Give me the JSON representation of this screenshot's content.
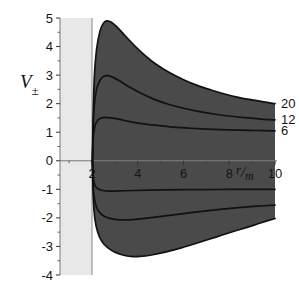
{
  "figure": {
    "kind": "effective-potential-plot",
    "background_color": "#ffffff",
    "shaded_band_color": "#e8e8e8",
    "region_fill_color": "#4a4a4a",
    "curve_color": "#111111",
    "axis_color": "#777777"
  },
  "chart_data": {
    "type": "line",
    "title": "",
    "subtitle": "",
    "xlabel": "r/m",
    "ylabel": "V±",
    "xlim": [
      0,
      10
    ],
    "ylim": [
      -4,
      5
    ],
    "grid": false,
    "legend_position": "right-edge",
    "x_ticks": [
      2,
      4,
      6,
      8,
      10
    ],
    "x_tick_labels": [
      "2",
      "4",
      "6",
      "8",
      "10"
    ],
    "x_minor_ticks": [
      1,
      3,
      5,
      7,
      9
    ],
    "y_ticks": [
      -4,
      -3,
      -2,
      -1,
      0,
      1,
      2,
      3,
      4,
      5
    ],
    "y_tick_labels": [
      "-4",
      "-3",
      "-2",
      "-1",
      "0",
      "1",
      "2",
      "3",
      "4",
      "5"
    ],
    "y_minor_ticks": [
      -3.5,
      -2.5,
      -1.5,
      -0.5,
      0.5,
      1.5,
      2.5,
      3.5,
      4.5
    ],
    "horizon_x": 2,
    "shaded_band_x_range": [
      0.45,
      2.0
    ],
    "annotations": [
      {
        "text": "20",
        "x": 10,
        "y": 2.0,
        "placement": "right"
      },
      {
        "text": "12",
        "x": 10,
        "y": 1.45,
        "placement": "right"
      },
      {
        "text": "6",
        "x": 10,
        "y": 1.05,
        "placement": "right"
      }
    ],
    "series": [
      {
        "name": "V+ L=20",
        "label": "20",
        "branch": "upper",
        "points": [
          [
            2.02,
            0.0
          ],
          [
            2.05,
            1.6
          ],
          [
            2.1,
            2.9
          ],
          [
            2.2,
            3.9
          ],
          [
            2.35,
            4.55
          ],
          [
            2.5,
            4.82
          ],
          [
            2.65,
            4.9
          ],
          [
            2.85,
            4.85
          ],
          [
            3.1,
            4.68
          ],
          [
            3.4,
            4.42
          ],
          [
            3.8,
            4.08
          ],
          [
            4.3,
            3.7
          ],
          [
            4.8,
            3.38
          ],
          [
            5.4,
            3.08
          ],
          [
            6.0,
            2.84
          ],
          [
            6.6,
            2.64
          ],
          [
            7.2,
            2.48
          ],
          [
            7.8,
            2.34
          ],
          [
            8.4,
            2.22
          ],
          [
            9.0,
            2.13
          ],
          [
            9.5,
            2.06
          ],
          [
            10.0,
            2.0
          ]
        ]
      },
      {
        "name": "V+ L=12",
        "label": "12",
        "branch": "upper",
        "points": [
          [
            2.02,
            0.0
          ],
          [
            2.05,
            1.1
          ],
          [
            2.1,
            1.95
          ],
          [
            2.2,
            2.5
          ],
          [
            2.35,
            2.82
          ],
          [
            2.5,
            2.95
          ],
          [
            2.7,
            2.98
          ],
          [
            2.9,
            2.93
          ],
          [
            3.2,
            2.8
          ],
          [
            3.6,
            2.6
          ],
          [
            4.1,
            2.38
          ],
          [
            4.7,
            2.16
          ],
          [
            5.3,
            1.99
          ],
          [
            6.0,
            1.84
          ],
          [
            6.7,
            1.72
          ],
          [
            7.4,
            1.63
          ],
          [
            8.1,
            1.56
          ],
          [
            8.8,
            1.5
          ],
          [
            9.4,
            1.46
          ],
          [
            10.0,
            1.43
          ]
        ]
      },
      {
        "name": "V+ L=6",
        "label": "6",
        "branch": "upper",
        "points": [
          [
            2.02,
            0.0
          ],
          [
            2.05,
            0.75
          ],
          [
            2.12,
            1.2
          ],
          [
            2.25,
            1.42
          ],
          [
            2.4,
            1.5
          ],
          [
            2.6,
            1.52
          ],
          [
            2.85,
            1.5
          ],
          [
            3.2,
            1.45
          ],
          [
            3.6,
            1.38
          ],
          [
            4.1,
            1.31
          ],
          [
            4.7,
            1.25
          ],
          [
            5.4,
            1.19
          ],
          [
            6.1,
            1.15
          ],
          [
            6.8,
            1.12
          ],
          [
            7.6,
            1.09
          ],
          [
            8.4,
            1.07
          ],
          [
            9.2,
            1.06
          ],
          [
            10.0,
            1.05
          ]
        ]
      },
      {
        "name": "V- L=6",
        "label": "6",
        "branch": "lower",
        "points": [
          [
            2.02,
            0.0
          ],
          [
            2.05,
            -0.55
          ],
          [
            2.12,
            -0.85
          ],
          [
            2.25,
            -0.98
          ],
          [
            2.45,
            -1.04
          ],
          [
            2.7,
            -1.06
          ],
          [
            3.0,
            -1.06
          ],
          [
            3.4,
            -1.05
          ],
          [
            3.9,
            -1.04
          ],
          [
            4.5,
            -1.03
          ],
          [
            5.2,
            -1.02
          ],
          [
            6.0,
            -1.01
          ],
          [
            7.0,
            -1.01
          ],
          [
            8.0,
            -1.0
          ],
          [
            9.0,
            -1.0
          ],
          [
            10.0,
            -1.0
          ]
        ]
      },
      {
        "name": "V- L=12",
        "label": "12",
        "branch": "lower",
        "points": [
          [
            2.02,
            0.0
          ],
          [
            2.05,
            -0.85
          ],
          [
            2.12,
            -1.4
          ],
          [
            2.25,
            -1.72
          ],
          [
            2.45,
            -1.9
          ],
          [
            2.7,
            -2.0
          ],
          [
            3.0,
            -2.05
          ],
          [
            3.4,
            -2.07
          ],
          [
            3.9,
            -2.05
          ],
          [
            4.5,
            -2.0
          ],
          [
            5.2,
            -1.93
          ],
          [
            6.0,
            -1.85
          ],
          [
            6.8,
            -1.77
          ],
          [
            7.6,
            -1.7
          ],
          [
            8.4,
            -1.64
          ],
          [
            9.2,
            -1.59
          ],
          [
            10.0,
            -1.55
          ]
        ]
      },
      {
        "name": "V- L=20",
        "label": "20",
        "branch": "lower",
        "points": [
          [
            2.02,
            0.0
          ],
          [
            2.05,
            -1.2
          ],
          [
            2.12,
            -2.0
          ],
          [
            2.25,
            -2.5
          ],
          [
            2.45,
            -2.85
          ],
          [
            2.7,
            -3.05
          ],
          [
            3.0,
            -3.2
          ],
          [
            3.35,
            -3.3
          ],
          [
            3.7,
            -3.35
          ],
          [
            4.1,
            -3.35
          ],
          [
            4.6,
            -3.3
          ],
          [
            5.2,
            -3.2
          ],
          [
            5.9,
            -3.05
          ],
          [
            6.6,
            -2.88
          ],
          [
            7.3,
            -2.7
          ],
          [
            8.0,
            -2.52
          ],
          [
            8.7,
            -2.35
          ],
          [
            9.4,
            -2.17
          ],
          [
            10.0,
            -2.02
          ]
        ]
      }
    ],
    "filled_regions": [
      {
        "name": "upper-allowed-region",
        "between": [
          "V+ L=20",
          "zero-axis-at-horizon"
        ],
        "fill": "#4a4a4a"
      },
      {
        "name": "lower-allowed-region",
        "between": [
          "V- L=20",
          "zero-axis-at-horizon"
        ],
        "fill": "#4a4a4a"
      }
    ]
  }
}
